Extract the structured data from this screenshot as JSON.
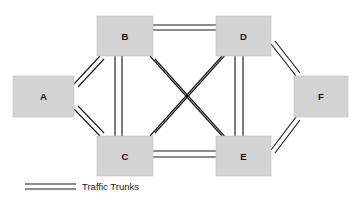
{
  "diagram": {
    "type": "network-topology",
    "canvas": {
      "width": 361,
      "height": 201,
      "background": "#ffffff"
    },
    "style": {
      "node_fill": "#d3d3d3",
      "node_stroke": "#c2c2c2",
      "line_color": "#1a1a1a",
      "line_width": 1.15,
      "trunk_rendering": "double-parallel-line"
    },
    "nodes": [
      {
        "id": "A",
        "label": "A",
        "x": 13,
        "y": 76,
        "w": 61,
        "h": 41,
        "cx": 43.5,
        "cy": 96.5
      },
      {
        "id": "B",
        "label": "B",
        "x": 97,
        "y": 16,
        "w": 56,
        "h": 40,
        "cx": 125,
        "cy": 36
      },
      {
        "id": "C",
        "label": "C",
        "x": 97,
        "y": 136,
        "w": 56,
        "h": 40,
        "cx": 125,
        "cy": 156
      },
      {
        "id": "D",
        "label": "D",
        "x": 216,
        "y": 16,
        "w": 55,
        "h": 40,
        "cx": 243.5,
        "cy": 36
      },
      {
        "id": "E",
        "label": "E",
        "x": 216,
        "y": 136,
        "w": 55,
        "h": 40,
        "cx": 243.5,
        "cy": 156
      },
      {
        "id": "F",
        "label": "F",
        "x": 294,
        "y": 76,
        "w": 54,
        "h": 41,
        "cx": 321,
        "cy": 96.5
      }
    ],
    "links": [
      {
        "id": "A-B",
        "from": "A",
        "to": "B",
        "kind": "traffic-trunk",
        "a": [
          74,
          84
        ],
        "b": [
          100,
          56
        ],
        "offset": [
          4,
          3
        ]
      },
      {
        "id": "A-C",
        "from": "A",
        "to": "C",
        "kind": "traffic-trunk",
        "a": [
          74,
          109
        ],
        "b": [
          100,
          136
        ],
        "offset": [
          4,
          -3
        ]
      },
      {
        "id": "B-D",
        "from": "B",
        "to": "D",
        "kind": "traffic-trunk",
        "a": [
          153,
          25
        ],
        "b": [
          216,
          25
        ],
        "offset": [
          0,
          5
        ]
      },
      {
        "id": "B-C",
        "from": "B",
        "to": "C",
        "kind": "traffic-trunk",
        "a": [
          115,
          56
        ],
        "b": [
          115,
          136
        ],
        "offset": [
          7,
          0
        ]
      },
      {
        "id": "B-E",
        "from": "B",
        "to": "E",
        "kind": "traffic-trunk",
        "a": [
          150,
          56
        ],
        "b": [
          222,
          136
        ],
        "offset": [
          5,
          3
        ]
      },
      {
        "id": "C-D",
        "from": "C",
        "to": "D",
        "kind": "traffic-trunk",
        "a": [
          150,
          136
        ],
        "b": [
          222,
          56
        ],
        "offset": [
          5,
          -3
        ]
      },
      {
        "id": "C-E",
        "from": "C",
        "to": "E",
        "kind": "traffic-trunk",
        "a": [
          153,
          151
        ],
        "b": [
          216,
          151
        ],
        "offset": [
          0,
          6
        ]
      },
      {
        "id": "D-E",
        "from": "D",
        "to": "E",
        "kind": "traffic-trunk",
        "a": [
          235,
          56
        ],
        "b": [
          235,
          136
        ],
        "offset": [
          8,
          0
        ]
      },
      {
        "id": "D-F",
        "from": "D",
        "to": "F",
        "kind": "traffic-trunk",
        "a": [
          271,
          44
        ],
        "b": [
          296,
          76
        ],
        "offset": [
          4,
          -3
        ]
      },
      {
        "id": "E-F",
        "from": "E",
        "to": "F",
        "kind": "traffic-trunk",
        "a": [
          271,
          150
        ],
        "b": [
          296,
          117
        ],
        "offset": [
          4,
          3
        ]
      }
    ]
  },
  "legend": {
    "label": "Traffic Trunks",
    "sample": {
      "x1": 25,
      "x2": 76,
      "y_top": 184,
      "y_bottom": 189
    },
    "text_x": 82,
    "text_y": 187
  }
}
